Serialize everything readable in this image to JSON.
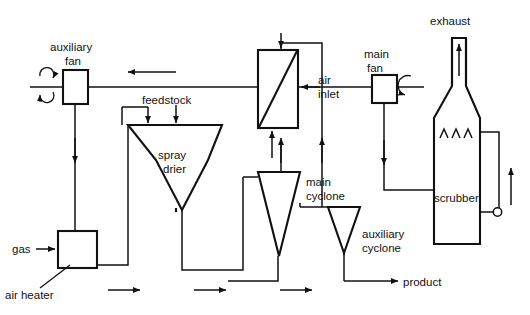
{
  "diagram": {
    "type": "process-flow-diagram",
    "stroke_color": "#111111",
    "background_color": "#ffffff",
    "labels": {
      "auxiliary_fan": "auxiliary\nfan",
      "auxiliary_fan_line1": "auxiliary",
      "auxiliary_fan_line2": "fan",
      "main_fan_line1": "main",
      "main_fan_line2": "fan",
      "feedstock": "feedstock",
      "spray_drier_line1": "spray",
      "spray_drier_line2": "drier",
      "air_inlet_line1": "air",
      "air_inlet_line2": "inlet",
      "main_cyclone_line1": "main",
      "main_cyclone_line2": "cyclone",
      "auxiliary_cyclone_line1": "auxiliary",
      "auxiliary_cyclone_line2": "cyclone",
      "exhaust": "exhaust",
      "scrubber": "scrubber",
      "gas": "gas",
      "air_heater": "air heater",
      "product": "product"
    },
    "equipment": [
      {
        "name": "auxiliary-fan",
        "kind": "fan",
        "label": "auxiliary fan"
      },
      {
        "name": "main-fan",
        "kind": "fan",
        "label": "main fan"
      },
      {
        "name": "heat-exchanger",
        "kind": "heat-exchanger",
        "label": "air inlet"
      },
      {
        "name": "spray-drier",
        "kind": "vessel",
        "label": "spray drier"
      },
      {
        "name": "main-cyclone",
        "kind": "cyclone",
        "label": "main cyclone"
      },
      {
        "name": "auxiliary-cyclone",
        "kind": "cyclone",
        "label": "auxiliary cyclone"
      },
      {
        "name": "scrubber",
        "kind": "scrubber",
        "label": "scrubber"
      },
      {
        "name": "air-heater",
        "kind": "heater",
        "label": "air heater"
      }
    ],
    "streams": [
      {
        "name": "gas-inlet",
        "label": "gas"
      },
      {
        "name": "feedstock-inlet",
        "label": "feedstock"
      },
      {
        "name": "air-inlet",
        "label": "air inlet"
      },
      {
        "name": "exhaust-outlet",
        "label": "exhaust"
      },
      {
        "name": "product-outlet",
        "label": "product"
      }
    ]
  }
}
